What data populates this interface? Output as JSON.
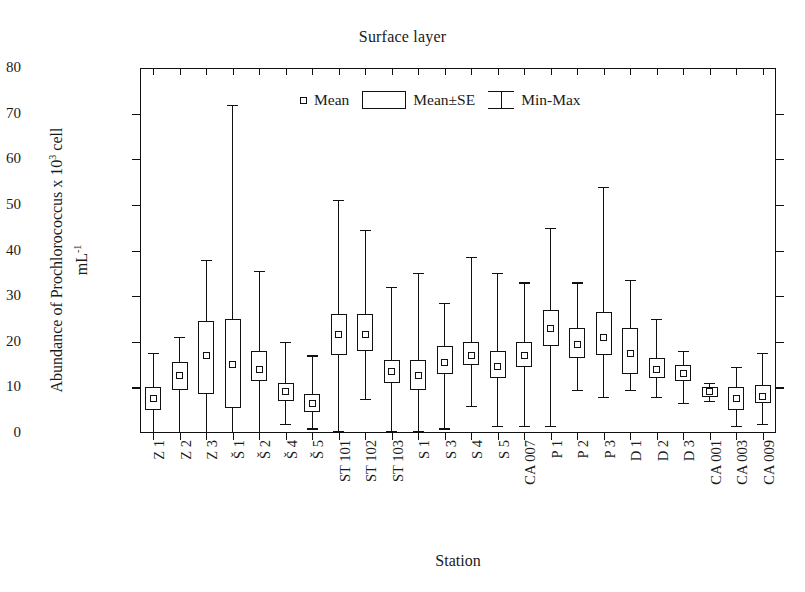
{
  "chart_data": {
    "type": "box",
    "title": "Surface layer",
    "xlabel": "Station",
    "ylabel_line1": "Abundance of Prochlorococcus x 10",
    "ylabel_sup": "3",
    "ylabel_line1b": " cell",
    "ylabel_line2": "mL",
    "ylabel_line2_sup": "-1",
    "ylim": [
      0,
      80
    ],
    "yticks": [
      0,
      10,
      20,
      30,
      40,
      50,
      60,
      70,
      80
    ],
    "grid": false,
    "legend_position": "top-center",
    "legend": [
      {
        "symbol": "mean-square",
        "label": "Mean"
      },
      {
        "symbol": "box",
        "label": "Mean±SE"
      },
      {
        "symbol": "whisker",
        "label": "Min-Max"
      }
    ],
    "categories": [
      "Z 1",
      "Z 2",
      "Z 3",
      "Š 1",
      "Š 2",
      "Š 4",
      "Š 5",
      "ST 101",
      "ST 102",
      "ST 103",
      "S 1",
      "S 3",
      "S 4",
      "S 5",
      "CA 007",
      "P 1",
      "P 2",
      "P 3",
      "D 1",
      "D 2",
      "D 3",
      "CA 001",
      "CA 003",
      "CA 009"
    ],
    "boxes": [
      {
        "station": "Z 1",
        "min": 0.2,
        "se_low": 5.0,
        "mean": 7.5,
        "se_high": 10.0,
        "max": 17.5
      },
      {
        "station": "Z 2",
        "min": 0.3,
        "se_low": 9.5,
        "mean": 12.5,
        "se_high": 15.5,
        "max": 21.0
      },
      {
        "station": "Z 3",
        "min": 0.3,
        "se_low": 8.5,
        "mean": 17.0,
        "se_high": 24.5,
        "max": 38.0
      },
      {
        "station": "Š 1",
        "min": 0.3,
        "se_low": 5.5,
        "mean": 15.0,
        "se_high": 25.0,
        "max": 72.0
      },
      {
        "station": "Š 2",
        "min": 0.3,
        "se_low": 11.5,
        "mean": 14.0,
        "se_high": 18.0,
        "max": 35.5
      },
      {
        "station": "Š 4",
        "min": 2.0,
        "se_low": 7.0,
        "mean": 9.0,
        "se_high": 11.0,
        "max": 20.0
      },
      {
        "station": "Š 5",
        "min": 1.0,
        "se_low": 4.5,
        "mean": 6.5,
        "se_high": 8.5,
        "max": 17.0
      },
      {
        "station": "ST 101",
        "min": 0.5,
        "se_low": 17.0,
        "mean": 21.5,
        "se_high": 26.0,
        "max": 51.0
      },
      {
        "station": "ST 102",
        "min": 7.5,
        "se_low": 18.0,
        "mean": 21.5,
        "se_high": 26.0,
        "max": 44.5
      },
      {
        "station": "ST 103",
        "min": 0.5,
        "se_low": 11.0,
        "mean": 13.5,
        "se_high": 16.0,
        "max": 32.0
      },
      {
        "station": "S 1",
        "min": 0.5,
        "se_low": 9.5,
        "mean": 12.5,
        "se_high": 16.0,
        "max": 35.0
      },
      {
        "station": "S 3",
        "min": 1.0,
        "se_low": 13.0,
        "mean": 15.5,
        "se_high": 19.0,
        "max": 28.5
      },
      {
        "station": "S 4",
        "min": 6.0,
        "se_low": 15.0,
        "mean": 17.0,
        "se_high": 20.0,
        "max": 38.5
      },
      {
        "station": "S 5",
        "min": 1.5,
        "se_low": 12.0,
        "mean": 14.5,
        "se_high": 18.0,
        "max": 35.0
      },
      {
        "station": "CA 007",
        "min": 1.5,
        "se_low": 14.5,
        "mean": 17.0,
        "se_high": 20.0,
        "max": 33.0
      },
      {
        "station": "P 1",
        "min": 1.5,
        "se_low": 19.0,
        "mean": 23.0,
        "se_high": 27.0,
        "max": 45.0
      },
      {
        "station": "P 2",
        "min": 9.5,
        "se_low": 16.5,
        "mean": 19.5,
        "se_high": 23.0,
        "max": 33.0
      },
      {
        "station": "P 3",
        "min": 8.0,
        "se_low": 17.0,
        "mean": 21.0,
        "se_high": 26.5,
        "max": 54.0
      },
      {
        "station": "D 1",
        "min": 9.5,
        "se_low": 13.0,
        "mean": 17.5,
        "se_high": 23.0,
        "max": 33.5
      },
      {
        "station": "D 2",
        "min": 8.0,
        "se_low": 12.0,
        "mean": 14.0,
        "se_high": 16.5,
        "max": 25.0
      },
      {
        "station": "D 3",
        "min": 6.5,
        "se_low": 11.5,
        "mean": 13.0,
        "se_high": 15.0,
        "max": 18.0
      },
      {
        "station": "CA 001",
        "min": 7.0,
        "se_low": 8.0,
        "mean": 9.0,
        "se_high": 10.0,
        "max": 11.0
      },
      {
        "station": "CA 003",
        "min": 1.5,
        "se_low": 5.0,
        "mean": 7.5,
        "se_high": 10.0,
        "max": 14.5
      },
      {
        "station": "CA 009",
        "min": 2.0,
        "se_low": 6.5,
        "mean": 8.0,
        "se_high": 10.5,
        "max": 17.5
      }
    ]
  }
}
